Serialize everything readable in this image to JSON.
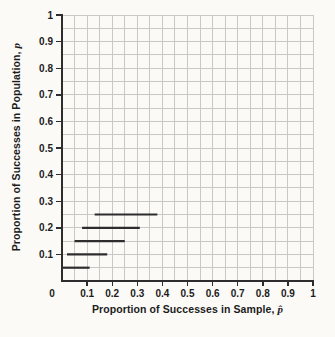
{
  "page": {
    "background": "#fbfaf7"
  },
  "chart_data": {
    "type": "line",
    "subtype": "horizontal-interval-segments",
    "title": "",
    "xlabel": "Proportion of Successes in Sample, p̂",
    "ylabel": "Proportion of Successes in Population, p",
    "xlim": [
      0,
      1
    ],
    "ylim": [
      0,
      1
    ],
    "grid": "on",
    "grid_step": 0.05,
    "legend": "none",
    "x_tick_values": [
      0,
      0.1,
      0.2,
      0.3,
      0.4,
      0.5,
      0.6,
      0.7,
      0.8,
      0.9,
      1
    ],
    "x_tick_labels": [
      "0",
      "0.1",
      "0.2",
      "0.3",
      "0.4",
      "0.5",
      "0.6",
      "0.7",
      "0.8",
      "0.9",
      "1"
    ],
    "y_tick_values": [
      0.1,
      0.2,
      0.3,
      0.4,
      0.5,
      0.6,
      0.7,
      0.8,
      0.9,
      1
    ],
    "y_tick_labels": [
      "0.1",
      "0.2",
      "0.3",
      "0.4",
      "0.5",
      "0.6",
      "0.7",
      "0.8",
      "0.9",
      "1"
    ],
    "segments": [
      {
        "p": 0.05,
        "phat_min": 0.0,
        "phat_max": 0.11
      },
      {
        "p": 0.1,
        "phat_min": 0.02,
        "phat_max": 0.18
      },
      {
        "p": 0.15,
        "phat_min": 0.05,
        "phat_max": 0.25
      },
      {
        "p": 0.2,
        "phat_min": 0.08,
        "phat_max": 0.31
      },
      {
        "p": 0.25,
        "phat_min": 0.13,
        "phat_max": 0.38
      }
    ],
    "colors": {
      "grid": "#c6c9c6",
      "axis": "#2d2d2d",
      "segment": "#2d2d2d",
      "text": "#1c1c1c",
      "background": "#fbfaf7"
    }
  },
  "axis_titles": {
    "x_text": "Proportion of Successes in Sample,",
    "x_symbol": "p̂",
    "y_text": "Proportion of Successes in Population,",
    "y_symbol": "p"
  }
}
